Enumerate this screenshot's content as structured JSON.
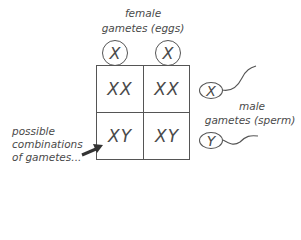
{
  "diagram": {
    "type": "punnett-square",
    "female_label": {
      "line1": "female",
      "line2": "gametes (eggs)"
    },
    "female_gametes": [
      "X",
      "X"
    ],
    "male_label": {
      "line1": "male",
      "line2": "gametes (sperm)"
    },
    "male_gametes": [
      "X",
      "Y"
    ],
    "grid": {
      "rows": [
        [
          "XX",
          "XX"
        ],
        [
          "XY",
          "XY"
        ]
      ]
    },
    "annotation": {
      "line1": "possible",
      "line2": "combinations",
      "line3": "of gametes..."
    },
    "colors": {
      "line": "#555555",
      "text": "#4a4a4a",
      "background": "#ffffff"
    }
  }
}
